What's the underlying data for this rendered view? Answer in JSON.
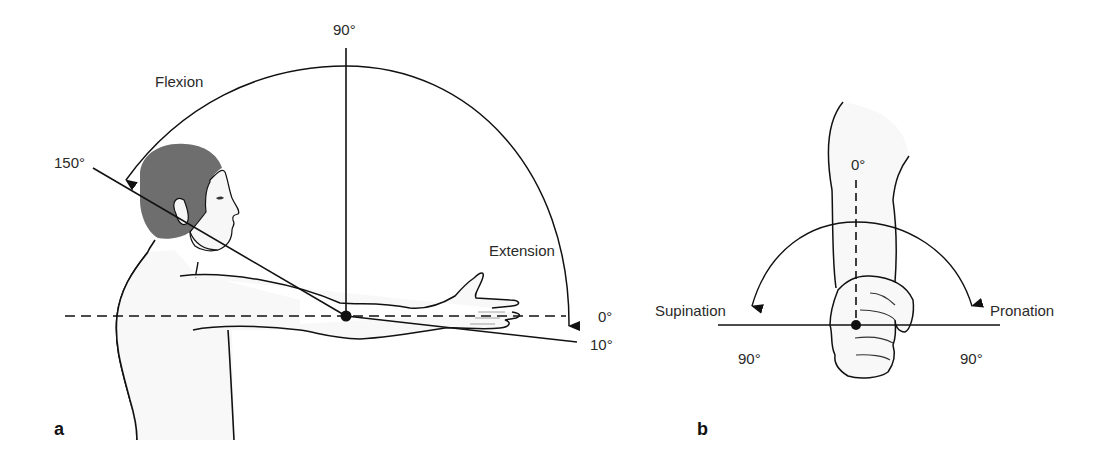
{
  "figure": {
    "panel_a": {
      "letter": "a",
      "labels": {
        "flexion": "Flexion",
        "extension": "Extension",
        "deg_90": "90°",
        "deg_150": "150°",
        "deg_0": "0°",
        "deg_10": "10°"
      }
    },
    "panel_b": {
      "letter": "b",
      "labels": {
        "deg_0": "0°",
        "supination": "Supination",
        "pronation": "Pronation",
        "deg_90_left": "90°",
        "deg_90_right": "90°"
      }
    },
    "colors": {
      "line": "#111111",
      "hair": "#6e6e6e",
      "skin": "#f7f7f7",
      "text": "#2a2a2a"
    }
  }
}
